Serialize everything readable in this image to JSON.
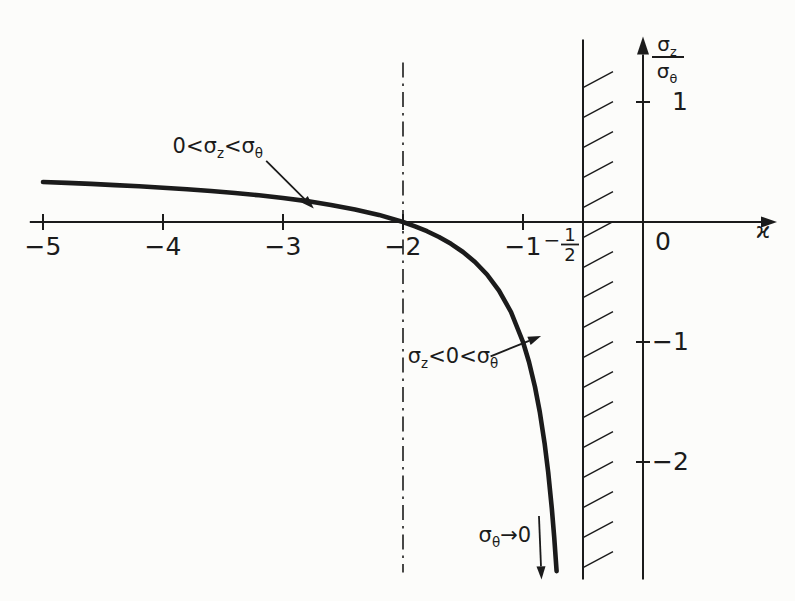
{
  "figure": {
    "background": "#fcfcfa",
    "ink": "#1b1b1b"
  },
  "chart_data": {
    "type": "line",
    "title": "",
    "xlabel": "ϰ",
    "ylabel": "σz/σθ",
    "ylabel_fraction": {
      "numerator": "σ_z",
      "denominator": "σ_θ"
    },
    "xlim": [
      -5.11,
      1.1
    ],
    "ylim": [
      -2.98,
      1.53
    ],
    "grid": false,
    "legend": "none",
    "x_ticks": [
      {
        "value": -5,
        "label": "−5",
        "tick": true
      },
      {
        "value": -4,
        "label": "−4",
        "tick": true
      },
      {
        "value": -3,
        "label": "−3",
        "tick": true
      },
      {
        "value": -2,
        "label": "−2",
        "tick": true
      },
      {
        "value": -1,
        "label": "−1",
        "tick": true
      },
      {
        "value": -0.5,
        "label_fraction": {
          "sign": "−",
          "num": "1",
          "den": "2"
        },
        "tick": false
      },
      {
        "value": 0,
        "label": "0",
        "tick": false,
        "label_dx": 12,
        "label_dy": 28
      }
    ],
    "y_ticks": [
      {
        "value": 1,
        "label": "1",
        "label_dx": 29
      },
      {
        "value": -1,
        "label": "−1",
        "label_dx": 9
      },
      {
        "value": -2,
        "label": "−2",
        "label_dx": 9
      }
    ],
    "series": [
      {
        "name": "sigma-z-over-sigma-theta-curve",
        "relation": "σz/σθ = (ϰ+2)/(2ϰ+1)",
        "points": [
          [
            -5.0,
            0.3333
          ],
          [
            -4.8,
            0.3256
          ],
          [
            -4.6,
            0.3171
          ],
          [
            -4.4,
            0.3077
          ],
          [
            -4.2,
            0.2973
          ],
          [
            -4.0,
            0.2857
          ],
          [
            -3.8,
            0.2727
          ],
          [
            -3.6,
            0.2581
          ],
          [
            -3.4,
            0.2414
          ],
          [
            -3.2,
            0.2222
          ],
          [
            -3.0,
            0.2
          ],
          [
            -2.8,
            0.1739
          ],
          [
            -2.6,
            0.1429
          ],
          [
            -2.4,
            0.1053
          ],
          [
            -2.2,
            0.0588
          ],
          [
            -2.0,
            0.0
          ],
          [
            -1.9,
            -0.0357
          ],
          [
            -1.8,
            -0.0769
          ],
          [
            -1.7,
            -0.125
          ],
          [
            -1.6,
            -0.1818
          ],
          [
            -1.5,
            -0.25
          ],
          [
            -1.4,
            -0.3333
          ],
          [
            -1.3,
            -0.4375
          ],
          [
            -1.2,
            -0.5714
          ],
          [
            -1.1,
            -0.75
          ],
          [
            -1.0,
            -1.0
          ],
          [
            -0.95,
            -1.1667
          ],
          [
            -0.9,
            -1.375
          ],
          [
            -0.86,
            -1.5833
          ],
          [
            -0.82,
            -1.8438
          ],
          [
            -0.79,
            -2.0862
          ],
          [
            -0.76,
            -2.3846
          ],
          [
            -0.74,
            -2.625
          ],
          [
            -0.72,
            -2.9091
          ]
        ]
      }
    ],
    "reference_lines": [
      {
        "name": "dash-dot-vertical",
        "style": "dash-dot",
        "x": -2,
        "y_top": 1.33,
        "y_bottom": -2.92
      },
      {
        "name": "hatched-boundary",
        "style": "hatched",
        "x": -0.5,
        "y_top": 1.52,
        "y_bottom": -2.98,
        "hatch_side": "right"
      }
    ],
    "annotations": [
      {
        "text": "0<σ_z<σ_θ",
        "pos": [
          -3.92,
          0.575
        ],
        "arrow": {
          "from": [
            -3.14,
            0.51
          ],
          "to": [
            -2.82,
            0.19
          ]
        }
      },
      {
        "text": "σ_z<0<σ_θ",
        "pos": [
          -1.96,
          -1.175
        ],
        "arrow": {
          "from": [
            -1.27,
            -1.12
          ],
          "to": [
            -0.95,
            -0.99
          ]
        }
      },
      {
        "text": "σ_θ→0",
        "pos": [
          -1.37,
          -2.665
        ],
        "arrow": {
          "from": [
            -0.867,
            -2.45
          ],
          "to": [
            -0.85,
            -2.87
          ]
        }
      }
    ]
  }
}
